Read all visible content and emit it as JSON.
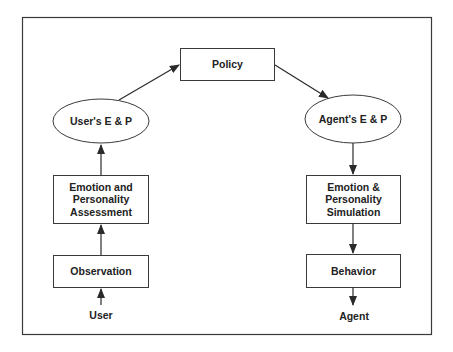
{
  "diagram": {
    "colors": {
      "stroke": "#3a3a3a",
      "text": "#222222",
      "background": "#ffffff"
    },
    "nodes": {
      "policy": {
        "label": "Policy",
        "shape": "rectangle"
      },
      "user_ep": {
        "label": "User's E & P",
        "shape": "ellipse"
      },
      "agent_ep": {
        "label": "Agent's E & P",
        "shape": "ellipse"
      },
      "assessment": {
        "line1": "Emotion and",
        "line2": "Personality",
        "line3": "Assessment",
        "shape": "rectangle"
      },
      "simulation": {
        "line1": "Emotion &",
        "line2": "Personality",
        "line3": "Simulation",
        "shape": "rectangle"
      },
      "observation": {
        "label": "Observation",
        "shape": "rectangle"
      },
      "behavior": {
        "label": "Behavior",
        "shape": "rectangle"
      },
      "user": {
        "label": "User",
        "shape": "text"
      },
      "agent": {
        "label": "Agent",
        "shape": "text"
      }
    },
    "edges": [
      {
        "from": "user",
        "to": "observation"
      },
      {
        "from": "observation",
        "to": "assessment"
      },
      {
        "from": "assessment",
        "to": "user_ep"
      },
      {
        "from": "user_ep",
        "to": "policy"
      },
      {
        "from": "policy",
        "to": "agent_ep"
      },
      {
        "from": "agent_ep",
        "to": "simulation"
      },
      {
        "from": "simulation",
        "to": "behavior"
      },
      {
        "from": "behavior",
        "to": "agent"
      }
    ]
  }
}
